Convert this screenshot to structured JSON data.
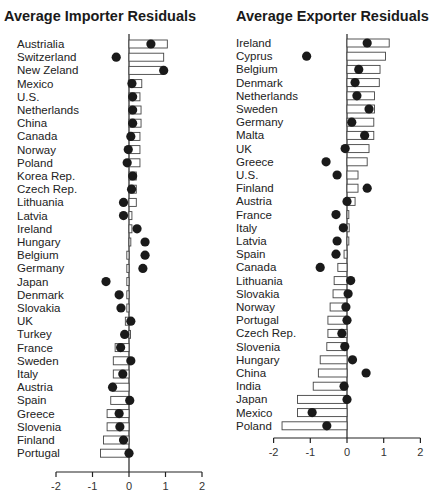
{
  "chart_data": [
    {
      "type": "bar",
      "title": "Average Importer Residuals",
      "xlabel": "",
      "ylabel": "",
      "xlim": [
        -2,
        2
      ],
      "xticks": [
        "-2",
        "-1",
        "0",
        "1",
        "2"
      ],
      "grid": false,
      "legend": "none",
      "categories": [
        "Austrialia",
        "Switzerland",
        "New Zeland",
        "Mexico",
        "U.S.",
        "Netherlands",
        "China",
        "Canada",
        "Norway",
        "Poland",
        "Korea Rep.",
        "Czech Rep.",
        "Lithuania",
        "Latvia",
        "Ireland",
        "Hungary",
        "Belgium",
        "Germany",
        "Japan",
        "Denmark",
        "Slovakia",
        "UK",
        "Turkey",
        "France",
        "Sweden",
        "Italy",
        "Austria",
        "Spain",
        "Greece",
        "Slovenia",
        "Finland",
        "Portugal"
      ],
      "series": [
        {
          "name": "bar",
          "mark": "hollow-bar",
          "values": [
            1.05,
            0.95,
            0.95,
            0.35,
            0.3,
            0.33,
            0.33,
            0.3,
            0.3,
            0.3,
            0.2,
            0.2,
            0.2,
            0.08,
            0.08,
            0.05,
            -0.06,
            -0.06,
            -0.06,
            -0.06,
            -0.06,
            -0.1,
            0.0,
            -0.38,
            -0.43,
            -0.43,
            -0.45,
            -0.5,
            -0.6,
            -0.6,
            -0.7,
            -0.78
          ]
        },
        {
          "name": "dot",
          "mark": "filled-circle",
          "values": [
            0.6,
            -0.35,
            0.95,
            0.08,
            0.1,
            0.1,
            0.1,
            0.05,
            -0.02,
            -0.05,
            0.1,
            0.07,
            -0.15,
            -0.15,
            0.22,
            0.44,
            0.44,
            0.38,
            -0.63,
            -0.27,
            -0.22,
            0.05,
            -0.12,
            -0.23,
            0.05,
            -0.17,
            -0.45,
            0.02,
            -0.27,
            -0.25,
            -0.15,
            0.0
          ]
        }
      ]
    },
    {
      "type": "bar",
      "title": "Average Exporter Residuals",
      "xlabel": "",
      "ylabel": "",
      "xlim": [
        -2,
        2
      ],
      "xticks": [
        "-2",
        "-1",
        "0",
        "1",
        "2"
      ],
      "grid": false,
      "legend": "none",
      "categories": [
        "Ireland",
        "Cyprus",
        "Belgium",
        "Denmark",
        "Netherlands",
        "Sweden",
        "Germany",
        "Malta",
        "UK",
        "Greece",
        "U.S.",
        "Finland",
        "Austria",
        "France",
        "Italy",
        "Latvia",
        "Spain",
        "Canada",
        "Lithuania",
        "Slovakia",
        "Norway",
        "Portugal",
        "Czech Rep.",
        "Slovenia",
        "Hungary",
        "China",
        "India",
        "Japan",
        "Mexico",
        "Poland"
      ],
      "series": [
        {
          "name": "bar",
          "mark": "hollow-bar",
          "values": [
            1.15,
            1.05,
            0.9,
            0.88,
            0.75,
            0.75,
            0.73,
            0.73,
            0.6,
            0.55,
            0.3,
            0.3,
            0.22,
            0.05,
            0.06,
            0.05,
            -0.08,
            -0.25,
            -0.35,
            -0.38,
            -0.46,
            -0.52,
            -0.52,
            -0.55,
            -0.73,
            -0.78,
            -0.92,
            -1.35,
            -1.35,
            -1.77
          ]
        },
        {
          "name": "dot",
          "mark": "filled-circle",
          "values": [
            0.55,
            -1.1,
            0.32,
            0.22,
            0.27,
            0.6,
            0.13,
            0.48,
            -0.05,
            -0.57,
            -0.27,
            0.55,
            0.0,
            -0.3,
            -0.1,
            -0.27,
            -0.3,
            -0.73,
            0.1,
            0.03,
            -0.03,
            0.0,
            -0.14,
            -0.06,
            0.15,
            0.52,
            -0.08,
            0.0,
            -0.95,
            -0.55
          ]
        }
      ]
    }
  ]
}
